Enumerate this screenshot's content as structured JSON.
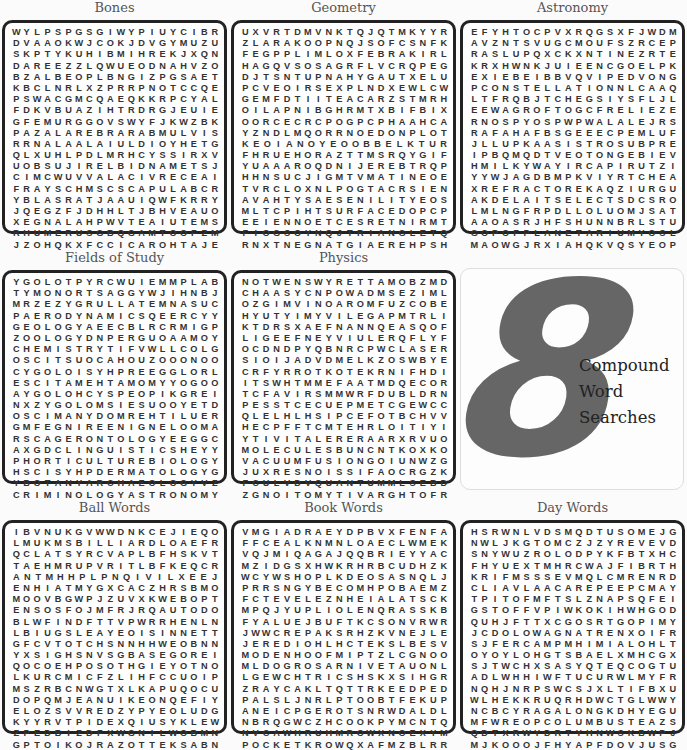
{
  "hero": {
    "number": "8",
    "line1": "Compound",
    "line2": "Word",
    "line3": "Searches"
  },
  "puzzles": [
    {
      "title": "Bones",
      "rows": [
        "WYLPSPGSGIWYPIUYCIBR",
        "DVAAOKWJCOKJDVGYMUZU",
        "SKPTYKUHIBMIHREKJXQN",
        "DAREEZZLQWUEODNAHVZO",
        "BZALBEOPLBNGIZPGSAET",
        "KBCLNRLXZPRRPNOTCCQE",
        "PSWACGMCQAEQKKRPCYAL",
        "FDKVBUAZIHTRDRGJEUIE",
        "GFEMURGGOVSWYFJKWZBK",
        "PAZALAREBRARABMULVIS",
        "RRNALAALAIULDIOYHETG",
        "QLXUHLPDLMRHCYSSIRXV",
        "UOBSUJIRELBIDNAMETSJ",
        "CIMCWUVVALACIVRECEAI",
        "FRAYSCHMSCSCAPULABCR",
        "YBLASRATJAAUIQWFKRRY",
        "JQEGZFJDHHLTJBHVEAUO",
        "XEGNALAHPWVTEAIUTEMS",
        "RHUMERUSGBQGAMTOOFZM",
        "JZOHQKXFCCICAROHTAJE"
      ]
    },
    {
      "title": "Geometry",
      "rows": [
        "UXVRTDMVNKTQJQTMKYYR",
        "ZLARAKOOPNQJSOFCSNFK",
        "FEGPPLIMLOXFEBRAKIRL",
        "HAGQVSOSAGRFLVCRQPEG",
        "DJTSNTUPNAHYGAUTXELU",
        "PCVEOIRSEXPLNDXEWLCW",
        "GEMFDTIITEACARZSTMRH",
        "OILAPNIBGHRMTXBIFBIX",
        "OORCECRCPOGPCPHAAHCA",
        "YZNDLMQORRNOEDONPLOT",
        "KEOIANOYEOOBBELKTUR",
        "FHRUEHORAZTTMSRQYGIF",
        "YUAAAROQDNIJEREBTRQPW",
        "HHNSUCJIGMTVMATINEOE",
        "TVRCLOXNLPOGTACRSIEN",
        "AVAHTYSAESENILITYEOS",
        "MLTCPIHTSURFACEDOPCP",
        "EEIENNOETCESRETNIRMT",
        "FIOGSOYNQJTRIANGLETQ",
        "RNXTNEGNATGIAEREHPSH"
      ]
    },
    {
      "title": "Astronomy",
      "rows": [
        "EFYHTOCPVXRQGSXFJWDM",
        "AVZNTSVUGCMOUFSZRCEP",
        "RASLUPQXCKXNTINEZRTE",
        "KRXHWNKJUIEENCGOELPK",
        "EXIEBEIBBVQVIPEDVONG",
        "PCONSTELLATIONNLCAAQ",
        "LTFRQBJTCHEGSIYSFLJL",
        "EEWAGROFTOGCFRELIEZE",
        "RNOSPYOSPWPWALALEJRS",
        "RAFAHAFBSGEEECPEMLUFR",
        "JLLUPKAASISTROSUBPRE",
        "IPBQMQDTVEOTONGEBIEV",
        "HMILKYWAYIRCAPIRUTZI",
        "YYWJAGDBMPKVIYRTCHEAN",
        "XREFRACTOREKAQZIURGU",
        "AKDELAITSELECTSDCSRO",
        "LMLNGFRPDLLOLUOMJSAT",
        "AAOASRJHFSHUNNBRLSTU",
        "GOPOFPLANETARIUMYOSL",
        "MAOWGJRXIAHQKVQSYEOP"
      ]
    },
    {
      "title": "Fields of Study",
      "rows": [
        "YGOLOTPYRCWUIEMMPLAB",
        "TYMONORTSAGGYWJIHNBJ",
        "MRZEZYGRULLATEMNASUC",
        "PAERODYNAMICSQEERCYY",
        "GEOLOGYAEECBLRCRMIGP",
        "ZOOLOGYDNPERGUOAAMOY",
        "CHEMISTRYTIFVWLLCOLG",
        "OSCITSUOCAHOUZOOONOO",
        "CYGOLOISYHPREEGGLORL",
        "ESCITAMEHTAMOMYYOGOO",
        "AYGOLOHCYSPEOPIKGREI",
        "NXZYGOLOMSIESUOOYETD",
        "OSCIMANYDOMREHTILUER",
        "GMFEGNIREENIGNELOOMA",
        "RSCAGERONTOLOGYEEGGC",
        "AXGDCLINGUISTICSHEYY",
        "PHORTICULTUREBIOLOGY",
        "HSCISYHPDERMATOLOGYG",
        "YBOTANYARCHAEOLOGYVZ",
        "CRIMINOLOGYASTRONOMY"
      ]
    },
    {
      "title": "Physics",
      "rows": [
        "NOTWENSWYRETTAMOBZMD",
        "CHAASYCNPOWADMSEZIML",
        "OZGIMVINOAROMFUZCOBE",
        "HYUTYIMYVILEGAPMTRLI",
        "KTDRSXAEFNANNQEASQOF",
        "LIGEEFNEYVIULERQFLYF",
        "OCDNDPYQBNRCPWCLASER",
        "SIOIJADVDMELKZOSWBYE",
        "CRFYRROTKOTEKRNIFHDI",
        "ITSWHTMMEFAATMDQECOR",
        "TCFAVIRSMMWRFDUBLDRN",
        "PESSTCECUEPMETCGEWCC",
        "QLELHLHSIPCEFOTBCHVV",
        "HECPFFTCMTEHRLOITIYI",
        "YTIVITALERERAARXRVUO",
        "MOLECULESBUNCNTKOXKO",
        "VACUUMFUSIONGOIUNWZG",
        "JUXRESNOISSIFAOCRGZK",
        "FCULVDVQUANTUMMLSEBD",
        "ZGNOITOMYTIVARGHTOFR"
      ]
    },
    {
      "title": "Ball Words",
      "rows": [
        "IBVNUKGVWWDNKCEJIEQO",
        "LMUKMSBILLIARDLOAEFR",
        "QCLATSYRCVAPLBFHSKVT",
        "TAEHMRUPVRITLBFKEQCR",
        "ANTMHHPLPNQIVILXEEJ",
        "ENHIATMYGXCACZHRSBMO",
        "MOOVBGWPJZUVXKWEBOPT",
        "ENSOSFOJMFRJRQAUTODO",
        "BLWFINDFTTVPWRRHENLN",
        "LBIUGSLEAYEOISINNETT",
        "GFCVTOTCHSNNHHWEOBNN",
        "YXSIGHSNVSGBASEGOREI",
        "QOCOEHPOSOTHGIEYOTNO",
        "LKURCMICFZLIHFCCUOIP",
        "MSZRBCNWGTXLKAPUQOCU",
        "DOPQMJEANUIKEONQEFIY",
        "ELOZSVVREDZYPYEOLUDG",
        "KYYRVTPIDEXQIUSYKLEW",
        "ZPEDBIZDFXWGNILWOBMN",
        "GPTOIKOJRAZOTTEKSABN"
      ]
    },
    {
      "title": "Book Words",
      "rows": [
        "VMGIADRAEYDPBVXFENFA",
        "FFCEALKNMNLOAECLWMEK",
        "VQJMIQAGAJQQBRIEYYAC",
        "MZIDGSXHWKRHRBCUDHZK",
        "WCYWSHOPLKDEOSASNQLJ",
        "PRRSNGYBECOMHPOBAEMZ",
        "FCTEVELEZNHEIALATSCK",
        "MPQJYUPLIOLENQRASSKB",
        "FYALUEJBUFTKCSONVRWR",
        "JWWCREPAKSRHZKVNEJLE",
        "JEREDIOHLHCTEKSLBESV",
        "MODENHOOFMIPTZLCGNOO",
        "MLDOGROSARNIVETAUONL",
        "LGEWCHTRICSHSKXSIHGR",
        "ZRAYCAKLTQTTRKEEDPED",
        "PALSLJNRLPTOOBTFEKUP",
        "ANEICPGEROTSNRWDALDL",
        "NBRQGWCZHCOOKPYMCNTQ",
        "NVCAWHRUHMROWXNOEXYM",
        "POCKETKROWQXAFMZBLRR"
      ]
    },
    {
      "title": "Day Words",
      "rows": [
        "HSRWNLVDSMQDTUSOMEJG",
        "NWLJKGTOMCZJZYREVEVD",
        "SNYWUZROLODPYKFBTXHC",
        "FHYUEXTMHRCWAJFIBRTH",
        "KRIFMSSSEVMQLCMRENRD",
        "CLIAVLAACAREPEEPCMAY",
        "TPITOFMFTSLZNAPSQFEI",
        "GSTOFFVPIWKOKIHWHGOD",
        "QUHJFTTXCGOSRTGOPIMY",
        "JCDOLOWAGNATRENXOIFR",
        "SJFERCAMPMHIMIALOHLT",
        "OYOYLOHGTSBAELXMHCGX",
        "SJTWCHXSASYQTEQCOGTU",
        "ADLWHHIWFTUCURWLMYFR",
        "NQHJNRPSWCSJXLTIFBXU",
        "WLHEKKRUQRHDWCTGLWWY",
        "NCBCYRAGALONGKDHYEGU",
        "MFWREOPCOLUMBUSTEAZS",
        "QDTXRWYDRTYHNWSKBWPJ",
        "MJKOOOJFHYAPFDOVJUSG"
      ]
    }
  ]
}
